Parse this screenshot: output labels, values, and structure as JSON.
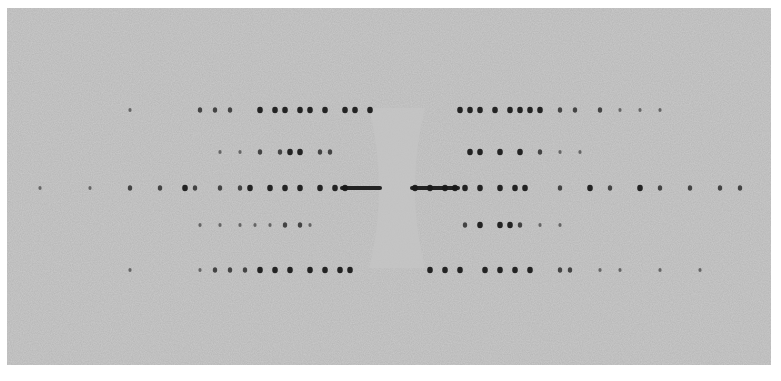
{
  "image": {
    "description": "X-ray fiber diffraction photograph showing layer lines of dark spots with a central beam stop region",
    "background_color": "#b4b4b4",
    "spot_color": "#1a1a1a",
    "frame": {
      "x": 7,
      "y": 8,
      "width": 764,
      "height": 357
    }
  },
  "layer_lines": [
    {
      "y": 110,
      "spots": [
        [
          130,
          1
        ],
        [
          200,
          2
        ],
        [
          215,
          2
        ],
        [
          230,
          2
        ],
        [
          260,
          3
        ],
        [
          275,
          3
        ],
        [
          285,
          3
        ],
        [
          300,
          3
        ],
        [
          310,
          3
        ],
        [
          325,
          3
        ],
        [
          345,
          3
        ],
        [
          355,
          3
        ],
        [
          370,
          3
        ],
        [
          460,
          3
        ],
        [
          470,
          3
        ],
        [
          480,
          3
        ],
        [
          495,
          3
        ],
        [
          510,
          3
        ],
        [
          520,
          3
        ],
        [
          530,
          3
        ],
        [
          540,
          3
        ],
        [
          560,
          2
        ],
        [
          575,
          2
        ],
        [
          600,
          2
        ],
        [
          620,
          1
        ],
        [
          640,
          1
        ],
        [
          660,
          1
        ]
      ]
    },
    {
      "y": 152,
      "spots": [
        [
          220,
          1
        ],
        [
          240,
          1
        ],
        [
          260,
          2
        ],
        [
          280,
          2
        ],
        [
          290,
          3
        ],
        [
          300,
          3
        ],
        [
          320,
          2
        ],
        [
          330,
          2
        ],
        [
          470,
          3
        ],
        [
          480,
          3
        ],
        [
          500,
          3
        ],
        [
          520,
          3
        ],
        [
          540,
          2
        ],
        [
          560,
          1
        ],
        [
          580,
          1
        ]
      ]
    },
    {
      "y": 188,
      "spots": [
        [
          40,
          1
        ],
        [
          90,
          1
        ],
        [
          130,
          2
        ],
        [
          160,
          2
        ],
        [
          185,
          3
        ],
        [
          195,
          2
        ],
        [
          220,
          2
        ],
        [
          240,
          2
        ],
        [
          250,
          3
        ],
        [
          270,
          3
        ],
        [
          285,
          3
        ],
        [
          300,
          3
        ],
        [
          320,
          3
        ],
        [
          335,
          3
        ],
        [
          345,
          3
        ],
        [
          415,
          3
        ],
        [
          430,
          3
        ],
        [
          445,
          3
        ],
        [
          455,
          3
        ],
        [
          465,
          3
        ],
        [
          480,
          3
        ],
        [
          500,
          3
        ],
        [
          515,
          3
        ],
        [
          525,
          3
        ],
        [
          560,
          2
        ],
        [
          590,
          3
        ],
        [
          610,
          2
        ],
        [
          640,
          3
        ],
        [
          660,
          2
        ],
        [
          690,
          2
        ],
        [
          720,
          2
        ],
        [
          740,
          2
        ]
      ]
    },
    {
      "y": 225,
      "spots": [
        [
          200,
          1
        ],
        [
          220,
          1
        ],
        [
          240,
          1
        ],
        [
          255,
          1
        ],
        [
          270,
          1
        ],
        [
          285,
          2
        ],
        [
          300,
          2
        ],
        [
          310,
          1
        ],
        [
          465,
          2
        ],
        [
          480,
          3
        ],
        [
          500,
          3
        ],
        [
          510,
          3
        ],
        [
          520,
          2
        ],
        [
          540,
          1
        ],
        [
          560,
          1
        ]
      ]
    },
    {
      "y": 270,
      "spots": [
        [
          130,
          1
        ],
        [
          200,
          1
        ],
        [
          215,
          2
        ],
        [
          230,
          2
        ],
        [
          245,
          2
        ],
        [
          260,
          3
        ],
        [
          275,
          3
        ],
        [
          290,
          3
        ],
        [
          310,
          3
        ],
        [
          325,
          3
        ],
        [
          340,
          3
        ],
        [
          350,
          3
        ],
        [
          430,
          3
        ],
        [
          445,
          3
        ],
        [
          460,
          3
        ],
        [
          485,
          3
        ],
        [
          500,
          3
        ],
        [
          515,
          3
        ],
        [
          530,
          3
        ],
        [
          560,
          2
        ],
        [
          570,
          2
        ],
        [
          600,
          1
        ],
        [
          620,
          1
        ],
        [
          660,
          1
        ],
        [
          700,
          1
        ]
      ]
    }
  ],
  "equator_streak": {
    "y": 188,
    "left_x1": 340,
    "left_x2": 382,
    "right_x1": 410,
    "right_x2": 460
  },
  "beam_stop": {
    "cx": 397,
    "cy": 188,
    "width": 30,
    "height": 160
  }
}
